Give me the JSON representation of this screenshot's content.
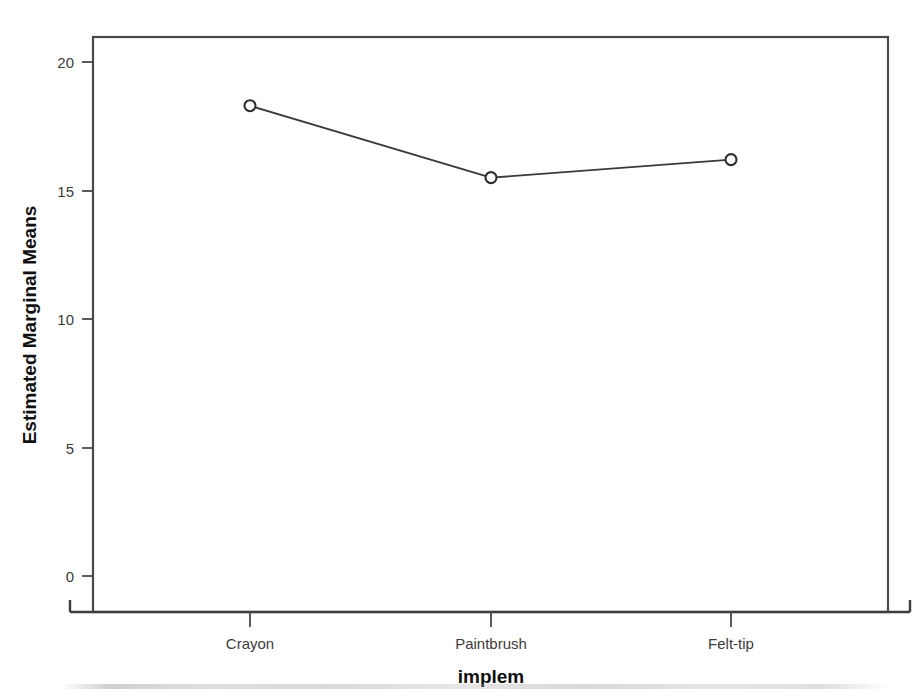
{
  "chart_data": {
    "type": "line",
    "title": "",
    "subtitle": "",
    "categories": [
      "Crayon",
      "Paintbrush",
      "Felt-tip"
    ],
    "values": [
      18.3,
      15.5,
      16.2
    ],
    "series": [
      {
        "name": "Estimated Marginal Means",
        "values": [
          18.3,
          15.5,
          16.2
        ]
      }
    ],
    "xlabel": "implem",
    "ylabel": "Estimated Marginal Means",
    "ylim": [
      0,
      21
    ],
    "ytick_labels": [
      "0",
      "5",
      "10",
      "15",
      "20"
    ],
    "ytick_values": [
      0,
      5,
      10,
      15,
      20
    ],
    "xtick_labels": [
      "Crayon",
      "Paintbrush",
      "Felt-tip"
    ],
    "grid": false,
    "legend": false,
    "legend_position": "none",
    "marker": "open-circle",
    "line_color": "#3a3a3a",
    "marker_fill": "#ffffff",
    "marker_stroke": "#2e2e2e",
    "frame_color": "#4a4a4a",
    "background_color": "#ffffff"
  },
  "axes": {
    "y_title": "Estimated Marginal Means",
    "x_title": "implem"
  }
}
